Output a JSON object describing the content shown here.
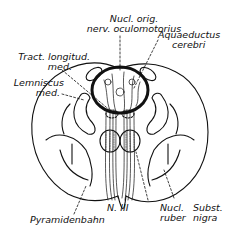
{
  "figure": {
    "labels": {
      "nucl_orig_1": "Nucl. orig.",
      "nucl_orig_2": "nerv. oculomotorius",
      "aquaeductus_1": "Aquaeductus",
      "aquaeductus_2": "cerebri",
      "tract_1": "Tract. longitud.",
      "tract_2": "med.",
      "lemniscus_1": "Lemniscus",
      "lemniscus_2": "med.",
      "pyramidenbahn": "Pyramidenbahn",
      "n_iii": "N. III",
      "nucl_ruber_1": "Nucl.",
      "nucl_ruber_2": "ruber",
      "subst_nigra_1": "Subst.",
      "subst_nigra_2": "nigra"
    },
    "colors": {
      "ink": "#111111",
      "background": "#ffffff"
    }
  }
}
